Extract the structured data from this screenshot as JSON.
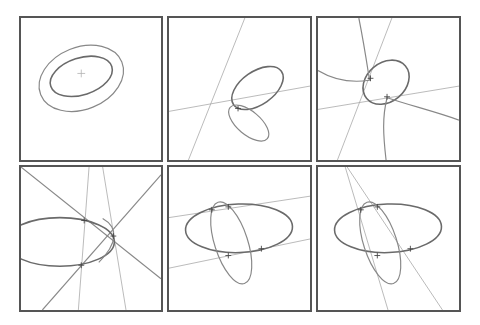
{
  "figure": {
    "layout": {
      "rows": 2,
      "cols": 3
    },
    "colors": {
      "border": "#555555",
      "curve": "#6a6a6a",
      "line": "#a8a8a8",
      "background": "#ffffff"
    },
    "panels": [
      {
        "id": 1,
        "content": "Two nested concentric tilted ellipses with a center cross marker"
      },
      {
        "id": 2,
        "content": "Two ellipses touching at one point with two straight thin lines crossing"
      },
      {
        "id": 3,
        "content": "Ellipse with hyperbola-like curve branches and two thin lines, intersection marks"
      },
      {
        "id": 4,
        "content": "Ellipse cut by two crossing diagonal lines and two near-vertical lines, three intersection marks"
      },
      {
        "id": 5,
        "content": "Horizontal ellipse and tilted ellipse intersecting at four points, two parallel thin lines through pairs"
      },
      {
        "id": 6,
        "content": "Horizontal ellipse and tilted ellipse intersecting at four points, two converging thin lines through pairs"
      }
    ]
  }
}
